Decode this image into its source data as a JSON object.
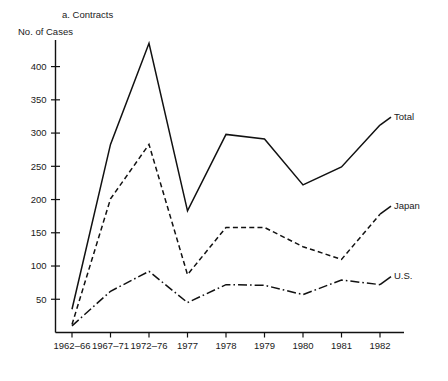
{
  "chart_data": {
    "type": "line",
    "title": "a. Contracts",
    "ylabel": "No. of Cases",
    "xlabel": "",
    "categories": [
      "1962–66",
      "1967–71",
      "1972–76",
      "1977",
      "1978",
      "1979",
      "1980",
      "1981",
      "1982"
    ],
    "series": [
      {
        "name": "Total",
        "style": "solid",
        "values": [
          35,
          283,
          435,
          183,
          298,
          291,
          222,
          249,
          312
        ]
      },
      {
        "name": "Japan",
        "style": "dashed",
        "values": [
          12,
          201,
          283,
          87,
          158,
          158,
          129,
          110,
          178
        ]
      },
      {
        "name": "U.S.",
        "style": "dash-dot",
        "values": [
          10,
          62,
          92,
          45,
          72,
          71,
          57,
          79,
          72
        ]
      }
    ],
    "ylim": [
      0,
      440
    ],
    "yticks": [
      50,
      100,
      150,
      200,
      250,
      300,
      350,
      400
    ],
    "ytick_labels": [
      "50",
      "100",
      "150",
      "200",
      "250",
      "300",
      "350",
      "400"
    ],
    "grid": false,
    "legend_position": "right-inline",
    "legend_entries": [
      "Total",
      "Japan",
      "U.S."
    ],
    "line_color": "#111111"
  }
}
